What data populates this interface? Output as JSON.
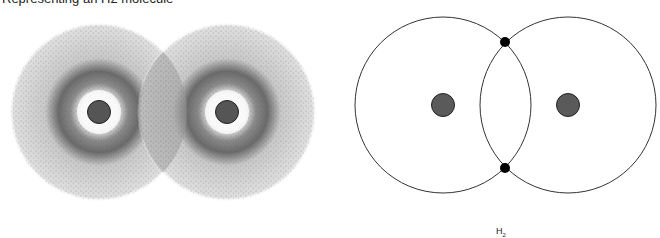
{
  "caption_top": "Representing an H2 molecule",
  "left_panel": {
    "title": "electron cloud model",
    "atoms": [
      {
        "cx": 99,
        "cy": 112
      },
      {
        "cx": 227,
        "cy": 112
      }
    ],
    "radius": 88,
    "nucleus_color": "#555555"
  },
  "right_panel": {
    "title": "shell model",
    "atoms": [
      {
        "cx": 443,
        "cy": 105
      },
      {
        "cx": 568,
        "cy": 105
      }
    ],
    "radius": 88,
    "electrons": [
      {
        "cx": 505,
        "cy": 42
      },
      {
        "cx": 505,
        "cy": 168
      }
    ],
    "nucleus_color": "#5a5a5a",
    "label": "H",
    "label_sub": "2"
  }
}
